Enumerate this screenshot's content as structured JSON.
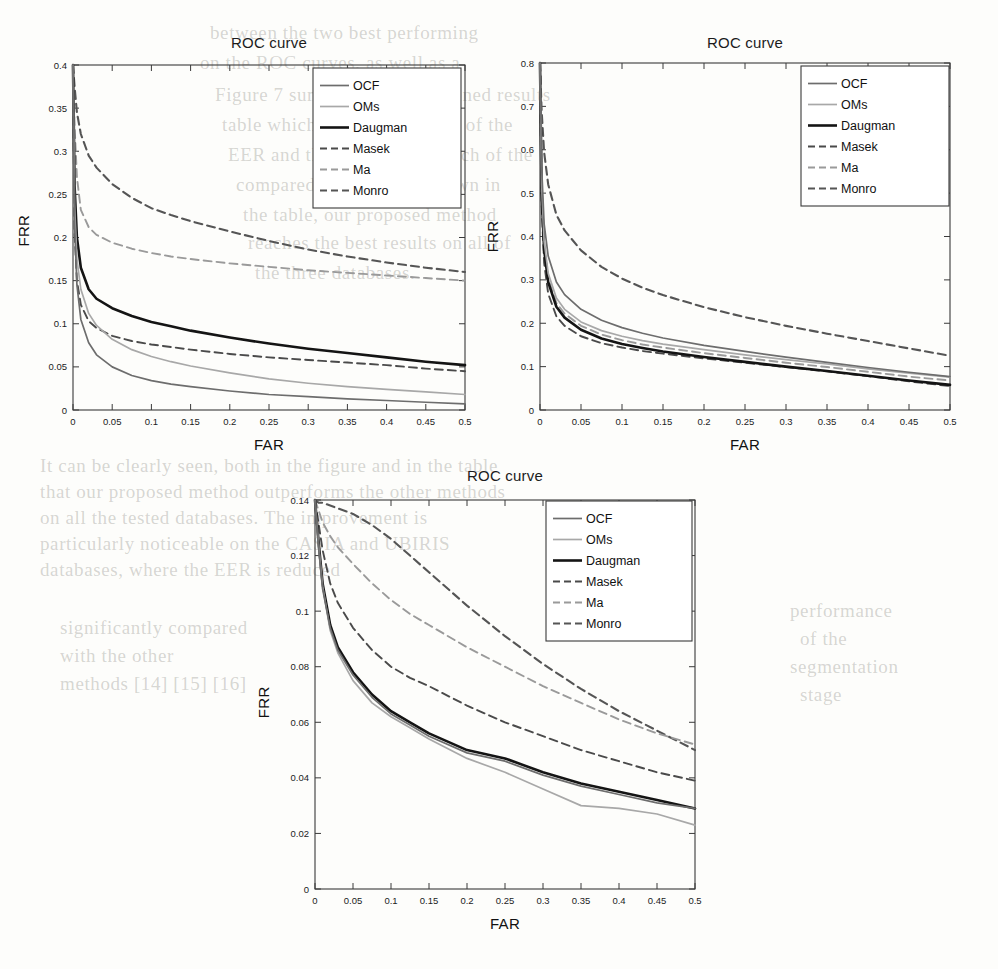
{
  "page": {
    "background_color": "#fdfdfb",
    "bleed_text": [
      {
        "t": "between the two best performing",
        "x": 210,
        "y": 22
      },
      {
        "t": "on the ROC curves, as well as a",
        "x": 200,
        "y": 52
      },
      {
        "t": "Figure 7 summarizes the obtained results",
        "x": 215,
        "y": 84
      },
      {
        "t": "table which shows the values of the",
        "x": 222,
        "y": 114
      },
      {
        "t": "EER and the accuracy for each of the",
        "x": 228,
        "y": 144
      },
      {
        "t": "compared methods. As shown in",
        "x": 236,
        "y": 174
      },
      {
        "t": "the table, our proposed method",
        "x": 243,
        "y": 204
      },
      {
        "t": "reaches the best results on all of",
        "x": 248,
        "y": 232
      },
      {
        "t": "the three databases.",
        "x": 255,
        "y": 262
      },
      {
        "t": "It can be clearly seen, both in the figure and in the table",
        "x": 40,
        "y": 455
      },
      {
        "t": "that our proposed method outperforms the other methods",
        "x": 40,
        "y": 481
      },
      {
        "t": "on all the tested databases. The improvement is",
        "x": 40,
        "y": 507
      },
      {
        "t": "particularly noticeable on the CASIA and UBIRIS",
        "x": 40,
        "y": 533
      },
      {
        "t": "databases, where the EER is reduced",
        "x": 40,
        "y": 559
      },
      {
        "t": "significantly compared",
        "x": 60,
        "y": 617
      },
      {
        "t": "with the other",
        "x": 60,
        "y": 645
      },
      {
        "t": "methods [14] [15] [16]",
        "x": 60,
        "y": 673
      },
      {
        "t": "performance",
        "x": 790,
        "y": 600
      },
      {
        "t": "of the",
        "x": 800,
        "y": 628
      },
      {
        "t": "segmentation",
        "x": 790,
        "y": 656
      },
      {
        "t": "stage",
        "x": 800,
        "y": 684
      }
    ]
  },
  "figure": {
    "shared": {
      "title": "ROC curve",
      "xlabel": "FAR",
      "ylabel": "FRR",
      "xticks": [
        "0",
        "0.05",
        "0.1",
        "0.15",
        "0.2",
        "0.25",
        "0.3",
        "0.35",
        "0.4",
        "0.45",
        "0.5"
      ],
      "legend": [
        {
          "label": "OCF",
          "color": "#6d6d6d",
          "dash": "none",
          "width": 1.7
        },
        {
          "label": "OMs",
          "color": "#a8a8a8",
          "dash": "none",
          "width": 1.7
        },
        {
          "label": "Daugman",
          "color": "#141414",
          "dash": "none",
          "width": 2.6
        },
        {
          "label": "Masek",
          "color": "#4a4a4a",
          "dash": "8,5",
          "width": 1.9
        },
        {
          "label": "Ma",
          "color": "#9a9a9a",
          "dash": "8,5",
          "width": 1.9
        },
        {
          "label": "Monro",
          "color": "#555555",
          "dash": "8,5",
          "width": 2.1
        }
      ]
    },
    "panels": [
      {
        "id": "panel-top-left",
        "title": "ROC curve",
        "yticks": [
          "0",
          "0.05",
          "0.1",
          "0.15",
          "0.2",
          "0.25",
          "0.3",
          "0.35",
          "0.4"
        ],
        "ylim": [
          0,
          0.4
        ]
      },
      {
        "id": "panel-top-right",
        "title": "ROC curve",
        "yticks": [
          "0",
          "0.1",
          "0.2",
          "0.3",
          "0.4",
          "0.5",
          "0.6",
          "0.7",
          "0.8"
        ],
        "ylim": [
          0,
          0.8
        ]
      },
      {
        "id": "panel-bottom",
        "title": "ROC curve",
        "yticks": [
          "0",
          "0.02",
          "0.04",
          "0.06",
          "0.08",
          "0.1",
          "0.12",
          "0.14"
        ],
        "ylim": [
          0,
          0.14
        ]
      }
    ]
  },
  "chart_data": [
    {
      "type": "line",
      "id": "panel-top-left",
      "title": "ROC curve",
      "xlabel": "FAR",
      "ylabel": "FRR",
      "xlim": [
        0,
        0.5
      ],
      "ylim": [
        0,
        0.4
      ],
      "grid": false,
      "legend_position": "top-right",
      "x": [
        0,
        0.002,
        0.005,
        0.01,
        0.02,
        0.03,
        0.05,
        0.075,
        0.1,
        0.125,
        0.15,
        0.2,
        0.25,
        0.3,
        0.35,
        0.4,
        0.45,
        0.5
      ],
      "series": [
        {
          "name": "OCF",
          "values": [
            0.4,
            0.215,
            0.145,
            0.105,
            0.078,
            0.064,
            0.05,
            0.04,
            0.034,
            0.03,
            0.027,
            0.022,
            0.018,
            0.0155,
            0.013,
            0.011,
            0.009,
            0.007
          ]
        },
        {
          "name": "OMs",
          "values": [
            0.4,
            0.238,
            0.175,
            0.14,
            0.112,
            0.098,
            0.082,
            0.07,
            0.062,
            0.056,
            0.051,
            0.043,
            0.036,
            0.031,
            0.027,
            0.024,
            0.021,
            0.018
          ]
        },
        {
          "name": "Daugman",
          "values": [
            0.4,
            0.26,
            0.2,
            0.165,
            0.14,
            0.129,
            0.118,
            0.109,
            0.102,
            0.097,
            0.092,
            0.084,
            0.077,
            0.071,
            0.066,
            0.061,
            0.056,
            0.052
          ]
        },
        {
          "name": "Masek",
          "values": [
            0.4,
            0.205,
            0.15,
            0.122,
            0.103,
            0.095,
            0.086,
            0.08,
            0.076,
            0.073,
            0.07,
            0.065,
            0.061,
            0.058,
            0.055,
            0.052,
            0.048,
            0.045
          ]
        },
        {
          "name": "Ma",
          "values": [
            0.4,
            0.33,
            0.27,
            0.232,
            0.212,
            0.203,
            0.194,
            0.187,
            0.182,
            0.178,
            0.175,
            0.17,
            0.166,
            0.162,
            0.159,
            0.156,
            0.153,
            0.15
          ]
        },
        {
          "name": "Monro",
          "values": [
            0.4,
            0.375,
            0.345,
            0.32,
            0.295,
            0.281,
            0.262,
            0.246,
            0.234,
            0.226,
            0.219,
            0.207,
            0.196,
            0.186,
            0.178,
            0.171,
            0.165,
            0.16
          ]
        }
      ]
    },
    {
      "type": "line",
      "id": "panel-top-right",
      "title": "ROC curve",
      "xlabel": "FAR",
      "ylabel": "FRR",
      "xlim": [
        0,
        0.5
      ],
      "ylim": [
        0,
        0.8
      ],
      "grid": false,
      "legend_position": "top-right",
      "x": [
        0,
        0.002,
        0.005,
        0.01,
        0.02,
        0.03,
        0.05,
        0.075,
        0.1,
        0.125,
        0.15,
        0.2,
        0.25,
        0.3,
        0.35,
        0.4,
        0.45,
        0.5
      ],
      "series": [
        {
          "name": "OCF",
          "values": [
            0.8,
            0.56,
            0.43,
            0.355,
            0.295,
            0.266,
            0.232,
            0.207,
            0.19,
            0.177,
            0.166,
            0.149,
            0.135,
            0.122,
            0.11,
            0.098,
            0.087,
            0.077
          ]
        },
        {
          "name": "OMs",
          "values": [
            0.8,
            0.52,
            0.39,
            0.315,
            0.258,
            0.232,
            0.203,
            0.183,
            0.17,
            0.16,
            0.152,
            0.139,
            0.127,
            0.116,
            0.106,
            0.095,
            0.085,
            0.076
          ]
        },
        {
          "name": "Daugman",
          "values": [
            0.8,
            0.5,
            0.37,
            0.295,
            0.238,
            0.213,
            0.185,
            0.165,
            0.152,
            0.143,
            0.135,
            0.122,
            0.111,
            0.1,
            0.09,
            0.079,
            0.068,
            0.058
          ]
        },
        {
          "name": "Masek",
          "values": [
            0.8,
            0.47,
            0.34,
            0.268,
            0.216,
            0.194,
            0.17,
            0.154,
            0.144,
            0.136,
            0.13,
            0.119,
            0.109,
            0.099,
            0.089,
            0.078,
            0.066,
            0.055
          ]
        },
        {
          "name": "Ma",
          "values": [
            0.8,
            0.505,
            0.378,
            0.303,
            0.247,
            0.222,
            0.194,
            0.174,
            0.161,
            0.151,
            0.144,
            0.131,
            0.12,
            0.109,
            0.099,
            0.088,
            0.077,
            0.068
          ]
        },
        {
          "name": "Monro",
          "values": [
            0.8,
            0.69,
            0.595,
            0.52,
            0.45,
            0.414,
            0.368,
            0.33,
            0.303,
            0.282,
            0.265,
            0.237,
            0.214,
            0.194,
            0.176,
            0.159,
            0.142,
            0.125
          ]
        }
      ]
    },
    {
      "type": "line",
      "id": "panel-bottom",
      "title": "ROC curve",
      "xlabel": "FAR",
      "ylabel": "FRR",
      "xlim": [
        0,
        0.5
      ],
      "ylim": [
        0,
        0.14
      ],
      "grid": false,
      "legend_position": "top-right",
      "x": [
        0,
        0.005,
        0.01,
        0.02,
        0.03,
        0.05,
        0.075,
        0.1,
        0.125,
        0.15,
        0.2,
        0.25,
        0.3,
        0.35,
        0.4,
        0.45,
        0.5
      ],
      "series": [
        {
          "name": "OCF",
          "values": [
            0.14,
            0.122,
            0.108,
            0.094,
            0.086,
            0.077,
            0.069,
            0.063,
            0.059,
            0.055,
            0.049,
            0.046,
            0.041,
            0.037,
            0.034,
            0.031,
            0.029
          ]
        },
        {
          "name": "OMs",
          "values": [
            0.14,
            0.123,
            0.109,
            0.093,
            0.085,
            0.075,
            0.067,
            0.062,
            0.058,
            0.054,
            0.047,
            0.042,
            0.036,
            0.03,
            0.029,
            0.027,
            0.023
          ]
        },
        {
          "name": "Daugman",
          "values": [
            0.14,
            0.124,
            0.11,
            0.095,
            0.087,
            0.078,
            0.07,
            0.064,
            0.06,
            0.056,
            0.05,
            0.047,
            0.042,
            0.038,
            0.035,
            0.032,
            0.029
          ]
        },
        {
          "name": "Masek",
          "values": [
            0.14,
            0.131,
            0.122,
            0.11,
            0.103,
            0.094,
            0.086,
            0.08,
            0.076,
            0.073,
            0.066,
            0.06,
            0.055,
            0.05,
            0.046,
            0.042,
            0.039
          ]
        },
        {
          "name": "Ma",
          "values": [
            0.14,
            0.136,
            0.132,
            0.127,
            0.123,
            0.117,
            0.11,
            0.104,
            0.099,
            0.095,
            0.087,
            0.08,
            0.073,
            0.067,
            0.061,
            0.056,
            0.052
          ]
        },
        {
          "name": "Monro",
          "values": [
            0.14,
            0.139,
            0.139,
            0.138,
            0.137,
            0.135,
            0.131,
            0.126,
            0.12,
            0.114,
            0.102,
            0.091,
            0.081,
            0.072,
            0.064,
            0.057,
            0.05
          ]
        }
      ]
    }
  ]
}
